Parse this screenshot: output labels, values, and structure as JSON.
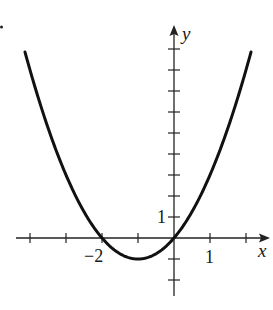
{
  "chart_data": {
    "type": "line",
    "title": "",
    "function": "y = x^2 + 2x",
    "xlabel": "x",
    "ylabel": "y",
    "tick_labels": {
      "x": [
        "-2",
        "1"
      ],
      "y": [
        "1"
      ]
    },
    "xlim": [
      -4.2,
      2.7
    ],
    "ylim": [
      -2.8,
      9.3
    ],
    "x_ticks": [
      -4,
      -3,
      -2,
      -1,
      1,
      2
    ],
    "y_ticks": [
      -2,
      -1,
      1,
      2,
      3,
      4,
      5,
      6,
      7,
      8,
      9
    ],
    "key_points": [
      {
        "x": -2,
        "y": 0,
        "label": "x-intercept"
      },
      {
        "x": 0,
        "y": 0,
        "label": "origin intercept"
      },
      {
        "x": -1,
        "y": -1,
        "label": "vertex"
      }
    ],
    "curve_x_range": [
      -4.14,
      2.14
    ],
    "grid": false,
    "legend": null
  },
  "labels": {
    "x_axis": "x",
    "y_axis": "y",
    "x_tick_neg2": "−2",
    "x_tick_1": "1",
    "y_tick_1": "1"
  },
  "colors": {
    "curve": "#111111",
    "axes": "#222222"
  }
}
